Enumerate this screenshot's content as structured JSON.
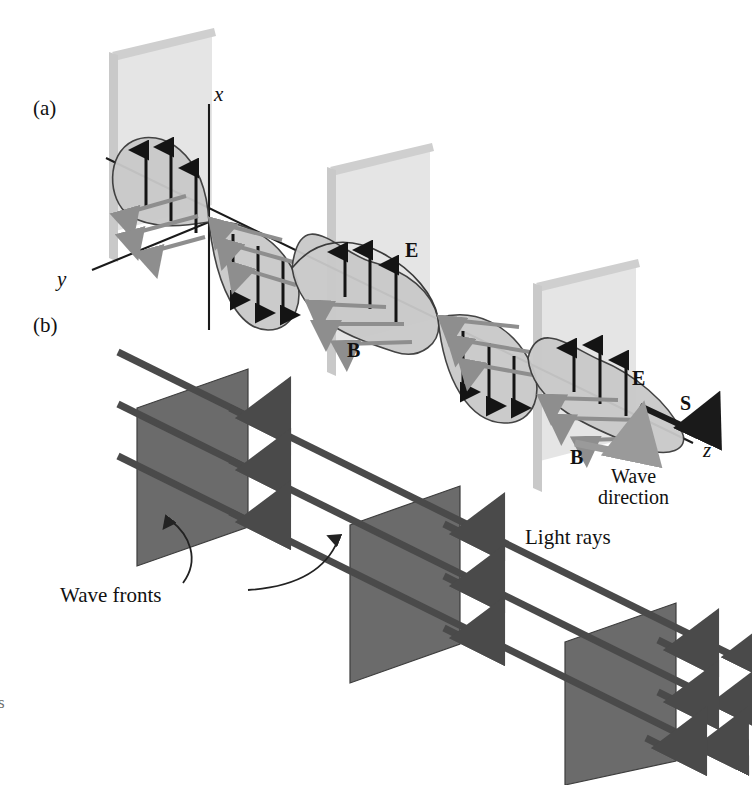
{
  "figure": {
    "background_color": "#ffffff"
  },
  "colors": {
    "lobe_fill": "#c9c9c9",
    "lobe_stroke": "#3a3a3a",
    "e_arrow": "#141414",
    "b_arrow": "#8e8e8e",
    "axis": "#1a1a1a",
    "wavefront_ghost": "#dedede",
    "wavefront_bar": "#c4c4c4",
    "plane_fill": "#6b6b6b",
    "plane_stroke": "#3d3d3d",
    "ray": "#4a4a4a",
    "s_arrow": "#1a1a1a",
    "wave_dir_arrow": "#9a9a9a",
    "leader": "#222222"
  },
  "panels": [
    {
      "id": "a",
      "label": "(a)",
      "x": 33,
      "y": 98
    },
    {
      "id": "b",
      "label": "(b)",
      "x": 33,
      "y": 315
    }
  ],
  "panel_a": {
    "axes": [
      {
        "name": "x-axis",
        "label": "x",
        "label_x": 214,
        "label_y": 96
      },
      {
        "name": "y-axis",
        "label": "y",
        "label_x": 59,
        "label_y": 279
      },
      {
        "name": "z-axis",
        "label": "z",
        "label_x": 703,
        "label_y": 449
      }
    ],
    "field_labels": [
      {
        "name": "E-field-label-1",
        "label": "E",
        "x": 405,
        "y": 240
      },
      {
        "name": "B-field-label-1",
        "label": "B",
        "x": 347,
        "y": 340
      },
      {
        "name": "E-field-label-2",
        "label": "E",
        "x": 632,
        "y": 368
      },
      {
        "name": "B-field-label-2",
        "label": "B",
        "x": 570,
        "y": 447
      }
    ],
    "poynting": {
      "label": "S",
      "x": 680,
      "y": 393
    },
    "wave_direction": {
      "label": "Wave\ndirection",
      "line1": "Wave",
      "line2": "direction",
      "x": 620,
      "y": 470
    },
    "description": "Sinusoidal electromagnetic wave travelling along z; E oscillates along x (black vertical arrows), B oscillates along y (gray diagonal arrows); four lobes of alternating sign with faint wave-front planes behind."
  },
  "panel_b": {
    "labels": [
      {
        "name": "wave-fronts-label",
        "label": "Wave fronts",
        "x": 60,
        "y": 585
      },
      {
        "name": "light-rays-label",
        "label": "Light rays",
        "x": 525,
        "y": 527
      }
    ],
    "wave_front_count": 3,
    "ray_count": 3,
    "description": "Three dark parallelogram wave fronts pierced by three parallel light rays travelling down-right; curved leader arrows point from the 'Wave fronts' caption to two of the planes."
  },
  "margin_note": {
    "label": "s",
    "x": 0,
    "y": 698
  }
}
